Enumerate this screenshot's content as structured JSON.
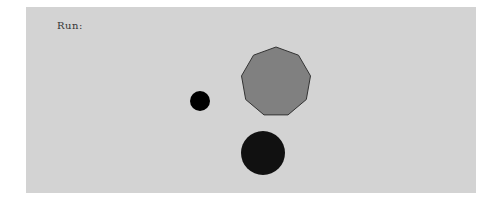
{
  "canvas": {
    "label": "Run:",
    "background": "#d3d3d3",
    "shapes": [
      {
        "type": "nonagon",
        "cx": 276,
        "cy": 82,
        "r": 35,
        "fill": "#808080",
        "stroke": "#333333"
      },
      {
        "type": "circle",
        "cx": 200,
        "cy": 101,
        "r": 10,
        "fill": "#000000"
      },
      {
        "type": "circle",
        "cx": 263,
        "cy": 153,
        "r": 22,
        "fill": "#111111"
      }
    ]
  }
}
